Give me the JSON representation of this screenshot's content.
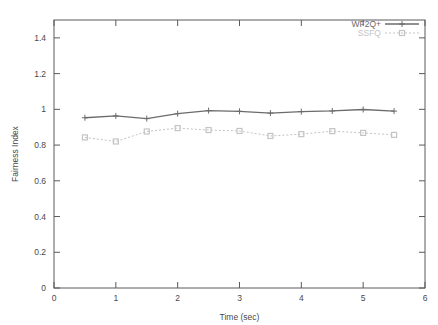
{
  "chart_data": {
    "type": "line",
    "title": "",
    "xlabel": "Time (sec)",
    "ylabel": "Fairness Index",
    "xlim": [
      0,
      6
    ],
    "ylim": [
      0,
      1.5
    ],
    "xticks": [
      "0",
      "1",
      "2",
      "3",
      "4",
      "5",
      "6"
    ],
    "xtick_values": [
      0,
      1,
      2,
      3,
      4,
      5,
      6
    ],
    "yticks": [
      "0",
      "0.2",
      "0.4",
      "0.6",
      "0.8",
      "1",
      "1.2",
      "1.4"
    ],
    "ytick_values": [
      0,
      0.2,
      0.4,
      0.6,
      0.8,
      1,
      1.2,
      1.4
    ],
    "grid": false,
    "legend_position": "top-right",
    "x": [
      0.5,
      1,
      1.5,
      2,
      2.5,
      3,
      3.5,
      4,
      4.5,
      5,
      5.5
    ],
    "series": [
      {
        "name": "WF2Q+",
        "color": "#6b6b6b",
        "linestyle": "solid",
        "marker": "plus",
        "values": [
          0.953,
          0.963,
          0.948,
          0.976,
          0.993,
          0.989,
          0.979,
          0.987,
          0.991,
          0.999,
          0.99
        ]
      },
      {
        "name": "SSFQ",
        "color": "#c4c4c4",
        "linestyle": "dotted",
        "marker": "square",
        "values": [
          0.843,
          0.82,
          0.876,
          0.895,
          0.884,
          0.879,
          0.851,
          0.861,
          0.878,
          0.868,
          0.857
        ]
      }
    ]
  },
  "legend": {
    "entries": [
      {
        "label": "WF2Q+"
      },
      {
        "label": "SSFQ"
      }
    ]
  },
  "axes": {
    "x_title": "Time (sec)",
    "y_title": "Fairness Index"
  }
}
